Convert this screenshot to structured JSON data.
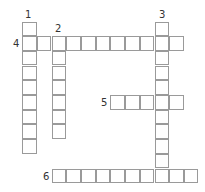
{
  "puzzle": {
    "type": "crossword",
    "cell_size": 14.7,
    "origin": {
      "x": 7.5,
      "y": 21.5
    },
    "clues": [
      {
        "number": "1",
        "direction": "down",
        "row": 0,
        "col": 1,
        "length": 9,
        "label_pos": {
          "x": 25,
          "y": 10
        }
      },
      {
        "number": "2",
        "direction": "down",
        "row": 1,
        "col": 3,
        "length": 7,
        "label_pos": {
          "x": 55,
          "y": 24
        }
      },
      {
        "number": "3",
        "direction": "down",
        "row": 0,
        "col": 10,
        "length": 11,
        "label_pos": {
          "x": 159,
          "y": 10
        }
      },
      {
        "number": "4",
        "direction": "across",
        "row": 1,
        "col": 1,
        "length": 11,
        "label_pos": {
          "x": 13,
          "y": 39
        }
      },
      {
        "number": "5",
        "direction": "across",
        "row": 5,
        "col": 7,
        "length": 5,
        "label_pos": {
          "x": 101,
          "y": 98
        }
      },
      {
        "number": "6",
        "direction": "across",
        "row": 10,
        "col": 3,
        "length": 10,
        "label_pos": {
          "x": 43,
          "y": 172
        }
      }
    ]
  }
}
